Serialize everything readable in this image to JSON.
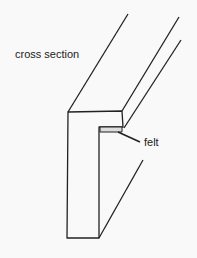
{
  "diagram": {
    "labels": {
      "cross_section": "cross section",
      "felt": "felt"
    },
    "colors": {
      "line": "#222222",
      "background": "#f9f9f9"
    }
  }
}
